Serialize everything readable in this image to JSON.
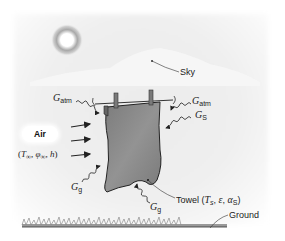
{
  "diagram": {
    "labels": {
      "sky": "Sky",
      "ground": "Ground",
      "air": "Air",
      "air_params": {
        "open": "(",
        "T": "T",
        "T_sub": "∞",
        "sep1": ", ",
        "phi": "φ",
        "phi_sub": "∞",
        "sep2": ", ",
        "h": "h",
        "close": ")"
      },
      "towel": {
        "name": "Towel (",
        "T": "T",
        "T_sub": "s",
        "sep1": ", ",
        "eps": "ε",
        "sep2": ", ",
        "alpha": "α",
        "alpha_sub": "S",
        "close": ")"
      },
      "g_atm_left": {
        "G": "G",
        "sub": "atm"
      },
      "g_atm_right": {
        "G": "G",
        "sub": "atm"
      },
      "g_s": {
        "G": "G",
        "sub": "S"
      },
      "g_g_left": {
        "G": "G",
        "sub": "g"
      },
      "g_g_bottom": {
        "G": "G",
        "sub": "g"
      }
    },
    "colors": {
      "towel_fill": "#8a8a8a",
      "towel_outline": "#222222",
      "sun_glow": "#9a9a9a",
      "background": "#efefef",
      "grass": "#8c8c8c",
      "arrow": "#222222"
    }
  }
}
